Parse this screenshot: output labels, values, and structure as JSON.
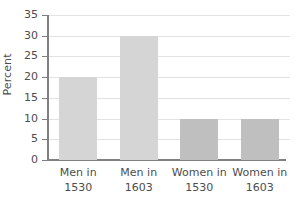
{
  "chart_data": {
    "type": "bar",
    "title": "",
    "xlabel": "",
    "ylabel": "Percent",
    "categories": [
      "Men in 1530",
      "Men in 1603",
      "Women in 1530",
      "Women in 1603"
    ],
    "category_lines": [
      [
        "Men in",
        "1530"
      ],
      [
        "Men in",
        "1603"
      ],
      [
        "Women in",
        "1530"
      ],
      [
        "Women in",
        "1603"
      ]
    ],
    "values": [
      20,
      30,
      10,
      10
    ],
    "bar_colors": [
      "#d5d5d5",
      "#d5d5d5",
      "#bfbfbf",
      "#bfbfbf"
    ],
    "ylim": [
      0,
      35
    ],
    "ytick_values": [
      0,
      5,
      10,
      15,
      20,
      25,
      30,
      35
    ],
    "ytick_labels": [
      "0",
      "5",
      "10",
      "15",
      "20",
      "25",
      "30",
      "35"
    ],
    "grid": true,
    "grid_color": "#e2e2e2",
    "axis_color": "#808080",
    "text_color": "#4d4d4d",
    "legend": null,
    "legend_position": "none",
    "background": "#ffffff"
  }
}
